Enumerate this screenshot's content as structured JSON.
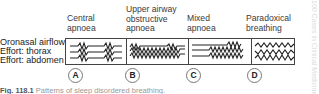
{
  "columns": [
    {
      "id": "A",
      "title_lines": [
        "Central",
        "apnoea"
      ],
      "letter": "A"
    },
    {
      "id": "B",
      "title_lines": [
        "Upper airway",
        "obstructive",
        "apnoea"
      ],
      "letter": "B"
    },
    {
      "id": "C",
      "title_lines": [
        "Mixed",
        "apnoea"
      ],
      "letter": "C"
    },
    {
      "id": "D",
      "title_lines": [
        "Paradoxical",
        "breathing"
      ],
      "letter": "D"
    }
  ],
  "rows": [
    "Oronasal airflow",
    "Effort: thorax",
    "Effort: abdomen"
  ],
  "caption": {
    "fig": "Fig. 118.1",
    "text": " Patterns of sleep disordered breathing."
  },
  "watermark": "100 Cases in Clinical Medicine"
}
